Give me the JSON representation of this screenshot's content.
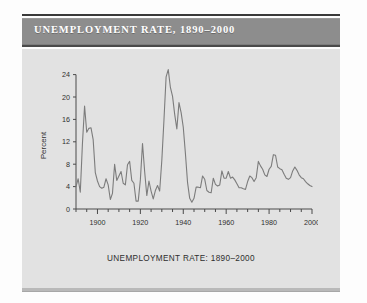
{
  "header": {
    "title": "UNEMPLOYMENT RATE, 1890–2000"
  },
  "figure": {
    "caption": "UNEMPLOYMENT RATE: 1890–2000",
    "ylabel": "Percent"
  },
  "colors": {
    "title_bar": "#8d8d8d",
    "title_text": "#ffffff",
    "panel": "#e2e2e2",
    "line": "#7c7c7c",
    "axis": "#4a4a4a",
    "page": "#fdfdfd"
  },
  "chart_data": {
    "type": "line",
    "title": "UNEMPLOYMENT RATE, 1890–2000",
    "xlabel": "",
    "ylabel": "Percent",
    "xlim": [
      1890,
      2000
    ],
    "ylim": [
      0,
      25
    ],
    "grid": false,
    "legend": null,
    "ytick_labels": [
      "0",
      "4",
      "8",
      "12",
      "16",
      "20",
      "24"
    ],
    "yticks": [
      0,
      4,
      8,
      12,
      16,
      20,
      24
    ],
    "xtick_labels": [
      "1900",
      "1920",
      "1940",
      "1960",
      "1980",
      "2000"
    ],
    "xticks": [
      1900,
      1920,
      1940,
      1960,
      1980,
      2000
    ],
    "xminor_step": 5,
    "series": [
      {
        "name": "Unemployment rate",
        "x": [
          1890,
          1891,
          1892,
          1893,
          1894,
          1895,
          1896,
          1897,
          1898,
          1899,
          1900,
          1901,
          1902,
          1903,
          1904,
          1905,
          1906,
          1907,
          1908,
          1909,
          1910,
          1911,
          1912,
          1913,
          1914,
          1915,
          1916,
          1917,
          1918,
          1919,
          1920,
          1921,
          1922,
          1923,
          1924,
          1925,
          1926,
          1927,
          1928,
          1929,
          1930,
          1931,
          1932,
          1933,
          1934,
          1935,
          1936,
          1937,
          1938,
          1939,
          1940,
          1941,
          1942,
          1943,
          1944,
          1945,
          1946,
          1947,
          1948,
          1949,
          1950,
          1951,
          1952,
          1953,
          1954,
          1955,
          1956,
          1957,
          1958,
          1959,
          1960,
          1961,
          1962,
          1963,
          1964,
          1965,
          1966,
          1967,
          1968,
          1969,
          1970,
          1971,
          1972,
          1973,
          1974,
          1975,
          1976,
          1977,
          1978,
          1979,
          1980,
          1981,
          1982,
          1983,
          1984,
          1985,
          1986,
          1987,
          1988,
          1989,
          1990,
          1991,
          1992,
          1993,
          1994,
          1995,
          1996,
          1997,
          1998,
          1999,
          2000
        ],
        "values": [
          4.0,
          5.4,
          3.0,
          11.7,
          18.4,
          13.7,
          14.4,
          14.5,
          12.4,
          6.5,
          5.0,
          4.0,
          3.7,
          3.9,
          5.4,
          4.3,
          1.7,
          2.8,
          8.0,
          5.1,
          5.9,
          6.7,
          4.6,
          4.3,
          7.9,
          8.5,
          5.1,
          4.6,
          1.4,
          1.4,
          5.2,
          11.7,
          6.7,
          2.4,
          5.0,
          3.2,
          1.8,
          3.3,
          4.2,
          3.2,
          8.7,
          15.9,
          23.6,
          24.9,
          21.7,
          20.1,
          16.9,
          14.3,
          19.0,
          17.2,
          14.6,
          9.9,
          4.7,
          1.9,
          1.2,
          1.9,
          3.9,
          3.9,
          3.8,
          5.9,
          5.3,
          3.3,
          3.0,
          2.9,
          5.5,
          4.4,
          4.1,
          4.3,
          6.8,
          5.5,
          5.5,
          6.7,
          5.5,
          5.7,
          5.2,
          4.5,
          3.8,
          3.8,
          3.6,
          3.5,
          4.9,
          5.9,
          5.6,
          4.9,
          5.6,
          8.5,
          7.7,
          7.1,
          6.1,
          5.8,
          7.1,
          7.6,
          9.7,
          9.6,
          7.5,
          7.2,
          7.0,
          6.2,
          5.5,
          5.3,
          5.6,
          6.8,
          7.5,
          6.9,
          6.1,
          5.6,
          5.4,
          4.9,
          4.5,
          4.2,
          4.0
        ]
      }
    ]
  }
}
